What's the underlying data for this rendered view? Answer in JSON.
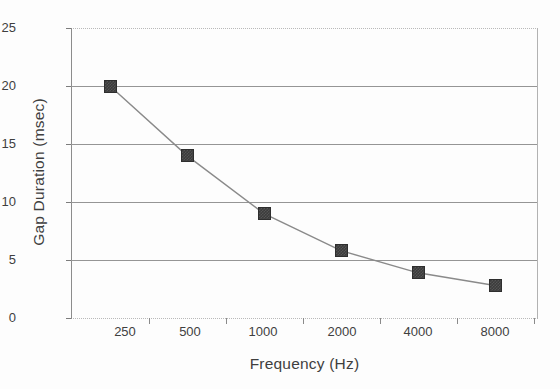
{
  "chart_data": {
    "type": "line",
    "title": "",
    "xlabel": "Frequency (Hz)",
    "ylabel": "Gap Duration (msec)",
    "x_tick_labels": [
      "250",
      "500",
      "1000",
      "2000",
      "4000",
      "8000"
    ],
    "x_values": [
      250,
      500,
      1000,
      2000,
      4000,
      8000
    ],
    "x_scale": "log",
    "y_tick_labels": [
      "0",
      "5",
      "10",
      "15",
      "20",
      "25"
    ],
    "y_ticks": [
      0,
      5,
      10,
      15,
      20,
      25
    ],
    "ylim": [
      0,
      25
    ],
    "grid": "horizontal",
    "legend": "none",
    "marker": "filled-square",
    "series": [
      {
        "name": "Gap Duration",
        "values": [
          20,
          14,
          9,
          5.8,
          3.9,
          2.8
        ]
      }
    ]
  },
  "style": {
    "line_color": "#8a8a8a",
    "marker_color": "#3b3b3b",
    "grid_color": "#959595",
    "axis_color": "#8c8c8c",
    "text_color": "#3f3f3f",
    "background": "#ffffff"
  }
}
